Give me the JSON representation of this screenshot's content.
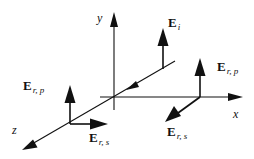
{
  "diagram": {
    "colors": {
      "ink": "#111111",
      "background": "#ffffff"
    },
    "axes": {
      "x": {
        "label": "x"
      },
      "y": {
        "label": "y"
      },
      "z": {
        "label": "z"
      }
    },
    "vectors": {
      "incident": {
        "main": "E",
        "sub": "i"
      },
      "reflected_p_right": {
        "main": "E",
        "sub": "r, p"
      },
      "reflected_s_right": {
        "main": "E",
        "sub": "r, s"
      },
      "reflected_p_left": {
        "main": "E",
        "sub": "r, p"
      },
      "reflected_s_left": {
        "main": "E",
        "sub": "r, s"
      }
    }
  }
}
